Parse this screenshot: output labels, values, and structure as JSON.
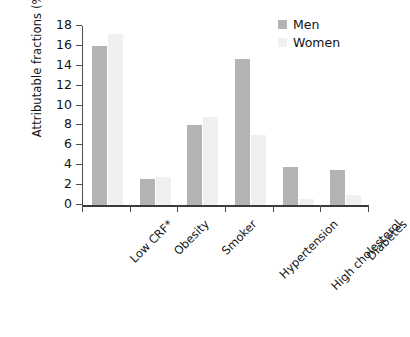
{
  "chart_data": {
    "type": "bar",
    "title": "",
    "subtitle": "",
    "xlabel": "",
    "ylabel": "Attributable fractions (%)",
    "categories": [
      "Low CRF*",
      "Obesity",
      "Smoker",
      "Hypertension",
      "High cholesterol",
      "Diabetes"
    ],
    "series": [
      {
        "name": "Men",
        "color": "#b3b3b3",
        "values": [
          16.0,
          2.6,
          8.0,
          14.7,
          3.8,
          3.5
        ]
      },
      {
        "name": "Women",
        "color": "#f0f0f0",
        "values": [
          17.2,
          2.8,
          8.9,
          7.0,
          0.6,
          1.0
        ]
      }
    ],
    "ylim": [
      0,
      18
    ],
    "yticks": [
      0,
      2,
      4,
      6,
      8,
      10,
      12,
      14,
      16,
      18
    ],
    "ytick_labels": [
      "0",
      "2",
      "4",
      "6",
      "8",
      "10",
      "12",
      "14",
      "16",
      "18"
    ],
    "grid": false,
    "legend_position": "top-right",
    "xtick_label_rotation": -45
  },
  "legend": {
    "items": [
      {
        "label": "Men",
        "color": "#b3b3b3"
      },
      {
        "label": "Women",
        "color": "#f0f0f0"
      }
    ]
  },
  "colors": {
    "men": "#b3b3b3",
    "women": "#f0f0f0",
    "axis": "#4d4d4d",
    "text": "#131313",
    "background": "#ffffff"
  }
}
